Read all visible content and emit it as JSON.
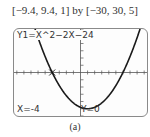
{
  "window_label": "[−9.4, 9.4, 1] by [−30, 30, 5]",
  "screen": {
    "equation": "Y1=X^2−2X−24",
    "trace_x": "X=-4",
    "trace_y": "Y=0"
  },
  "caption": "(a)",
  "chart_data": {
    "type": "line",
    "title": "",
    "function": "y = x^2 - 2x - 24",
    "xlabel": "",
    "ylabel": "",
    "xlim": [
      -9.4,
      9.4
    ],
    "ylim": [
      -30,
      30
    ],
    "xscl": 1,
    "yscl": 5,
    "grid": false,
    "trace_point": {
      "x": -4,
      "y": 0
    },
    "roots": [
      -4,
      6
    ],
    "vertex": {
      "x": 1,
      "y": -25
    },
    "series": [
      {
        "name": "Y1",
        "x": [
          -4.5,
          -4,
          -3,
          -2,
          -1,
          0,
          1,
          2,
          3,
          4,
          5,
          6,
          7,
          8
        ],
        "y": [
          5.25,
          0,
          -9,
          -16,
          -21,
          -24,
          -25,
          -24,
          -21,
          -16,
          -9,
          0,
          11,
          24
        ]
      }
    ]
  }
}
